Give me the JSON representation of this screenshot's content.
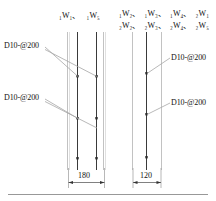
{
  "drawing": {
    "type": "structural-wall-reinforcement-section",
    "bottom_rule": true,
    "wall_tag_groups": [
      {
        "id": "left-wall-tags",
        "rows": [
          {
            "cells": [
              "₁W₁、",
              "₁W₅"
            ]
          }
        ]
      },
      {
        "id": "right-wall-tags",
        "rows": [
          {
            "cells": [
              "₁W₂、",
              "₁W₃、",
              "₁W₄、",
              "₂W₁"
            ]
          },
          {
            "cells": [
              "₂W₂、",
              "₂W₃、",
              "₂W₄、",
              "₂W₅"
            ]
          }
        ]
      }
    ],
    "annotations": [
      {
        "id": "annot-left-top",
        "text": "D10-@200"
      },
      {
        "id": "annot-left-bottom",
        "text": "D10-@200"
      },
      {
        "id": "annot-right-top",
        "text": "D10-@200"
      },
      {
        "id": "annot-right-bottom",
        "text": "D10-@200"
      }
    ],
    "dimensions": [
      {
        "id": "dim-left",
        "value": "180",
        "unit_implied": "mm"
      },
      {
        "id": "dim-right",
        "value": "120",
        "unit_implied": "mm"
      }
    ],
    "sections": [
      {
        "id": "left-section",
        "face_lines_x": [
          68,
          105
        ],
        "rebar_lines_x": [
          77,
          97
        ],
        "bar_marks_y": [
          76,
          118,
          158
        ]
      },
      {
        "id": "right-section",
        "face_lines_x": [
          133,
          163
        ],
        "rebar_lines_x": [
          146
        ],
        "bar_marks_y": [
          73,
          114,
          157
        ]
      }
    ],
    "colors": {
      "ink": "#1a1a1a",
      "rebar": "#3a3a3a",
      "face_line": "#b9b9b9",
      "leader": "#9a9a9a",
      "rule": "#8c8c8c"
    }
  }
}
